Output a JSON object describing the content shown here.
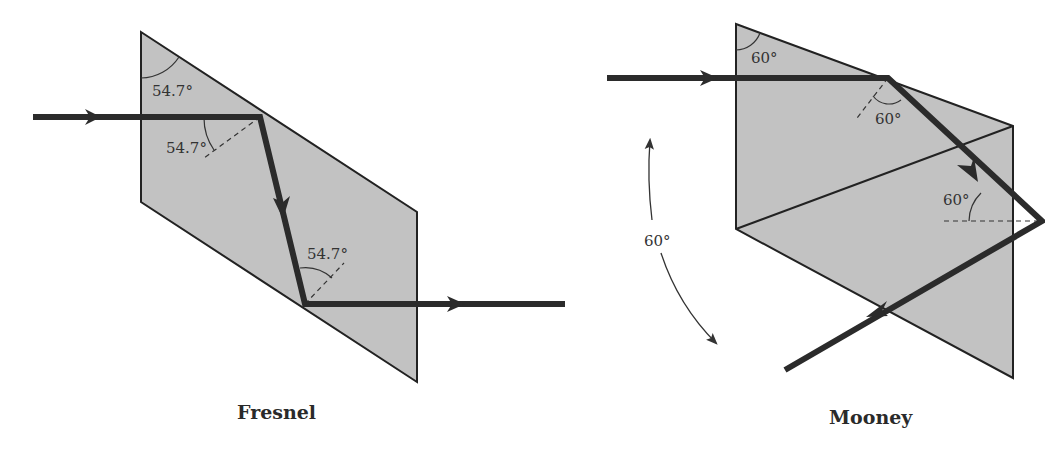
{
  "figure": {
    "colors": {
      "prism_fill": "#c2c2c2",
      "outline": "#222222",
      "ray": "#2b2b2b",
      "background": "#ffffff"
    },
    "fresnel": {
      "title": "Fresnel",
      "angle_labels": [
        "54.7°",
        "54.7°",
        "54.7°"
      ]
    },
    "mooney": {
      "title": "Mooney",
      "angle_labels": [
        "60°",
        "60°",
        "60°"
      ],
      "rotation_label": "60°"
    }
  }
}
